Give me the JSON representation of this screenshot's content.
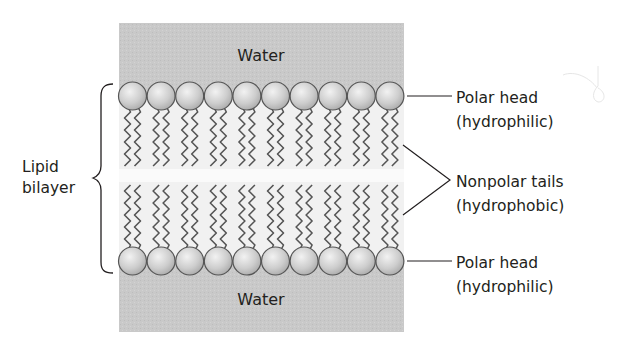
{
  "diagram": {
    "type": "lipid-bilayer-schematic",
    "regions": {
      "top_water_label": "Water",
      "bottom_water_label": "Water"
    },
    "left_label": {
      "line1": "Lipid",
      "line2": "bilayer"
    },
    "callouts": {
      "top_head": {
        "line1": "Polar head",
        "line2": "(hydrophilic)"
      },
      "tails": {
        "line1": "Nonpolar tails",
        "line2": "(hydrophobic)"
      },
      "bottom_head": {
        "line1": "Polar head",
        "line2": "(hydrophilic)"
      }
    },
    "phospholipid_count_per_leaflet": 10,
    "colors": {
      "water": "#c8c8c8",
      "interior": "#f2f2f2",
      "head_fill": "#cfcfcf",
      "head_stroke": "#555555",
      "tail_stroke": "#555555",
      "text": "#231f20"
    }
  }
}
